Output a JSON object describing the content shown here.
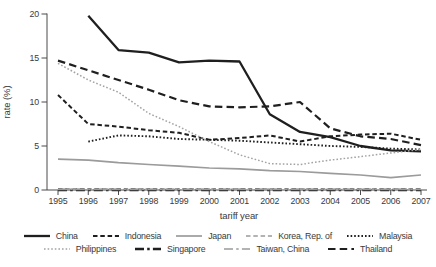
{
  "figure": {
    "background": "#ffffff",
    "axis_color": "#4a4a4a",
    "text_color": "#3a3a3a"
  },
  "chart_data": {
    "type": "line",
    "title": "",
    "xlabel": "tariff year",
    "ylabel": "rate (%)",
    "x": [
      1995,
      1996,
      1997,
      1998,
      1999,
      2000,
      2001,
      2002,
      2003,
      2004,
      2005,
      2006,
      2007
    ],
    "ylim": [
      0,
      20
    ],
    "yticks": [
      0,
      5,
      10,
      15,
      20
    ],
    "grid": false,
    "legend_position": "bottom",
    "series": [
      {
        "name": "China",
        "color": "#1f1f1f",
        "dash": "solid",
        "width": 2.3,
        "values": [
          null,
          19.8,
          15.9,
          15.6,
          14.5,
          14.7,
          14.6,
          8.6,
          6.6,
          6.0,
          5.0,
          4.5,
          4.4
        ]
      },
      {
        "name": "Indonesia",
        "color": "#1f1f1f",
        "dash": "short-dash",
        "width": 2.0,
        "values": [
          10.8,
          7.5,
          7.2,
          6.8,
          6.5,
          5.7,
          5.9,
          6.2,
          5.5,
          6.1,
          6.3,
          6.4,
          5.7
        ]
      },
      {
        "name": "Japan",
        "color": "#9b9b9b",
        "dash": "solid",
        "width": 1.7,
        "values": [
          3.5,
          3.4,
          3.1,
          2.9,
          2.7,
          2.5,
          2.4,
          2.2,
          2.1,
          1.9,
          1.7,
          1.4,
          1.7
        ]
      },
      {
        "name": "Korea, Rep. of",
        "color": "#9b9b9b",
        "dash": "short-dash",
        "width": 1.4,
        "values": [
          0,
          0,
          0,
          0,
          0,
          0,
          0,
          0,
          0,
          0,
          0,
          0,
          0
        ]
      },
      {
        "name": "Malaysia",
        "color": "#1f1f1f",
        "dash": "dot",
        "width": 1.9,
        "values": [
          null,
          5.5,
          6.2,
          6.1,
          5.8,
          5.7,
          5.6,
          5.4,
          5.2,
          5.0,
          4.9,
          4.7,
          4.6
        ]
      },
      {
        "name": "Philippines",
        "color": "#a3a3a3",
        "dash": "dot",
        "width": 1.5,
        "values": [
          14.4,
          12.5,
          11.1,
          8.7,
          7.2,
          5.5,
          4.0,
          3.0,
          2.9,
          3.4,
          3.8,
          4.2,
          4.6
        ]
      },
      {
        "name": "Singapore",
        "color": "#1f1f1f",
        "dash": "dash-dot",
        "width": 2.6,
        "values": [
          0,
          0,
          0,
          0,
          0,
          0,
          0,
          0,
          0,
          0,
          0,
          0,
          0
        ]
      },
      {
        "name": "Taiwan, China",
        "color": "#9b9b9b",
        "dash": "dash-dot",
        "width": 1.4,
        "values": [
          0,
          0,
          0,
          0,
          0,
          0,
          0,
          0,
          0,
          0,
          0,
          0,
          0
        ]
      },
      {
        "name": "Thailand",
        "color": "#1f1f1f",
        "dash": "long-dash",
        "width": 2.2,
        "values": [
          14.7,
          13.6,
          12.5,
          11.4,
          10.2,
          9.5,
          9.4,
          9.5,
          10.0,
          7.0,
          6.1,
          5.8,
          5.1
        ]
      }
    ],
    "legend_rows": [
      [
        0,
        1,
        2,
        3,
        4
      ],
      [
        5,
        6,
        7,
        8
      ]
    ]
  }
}
